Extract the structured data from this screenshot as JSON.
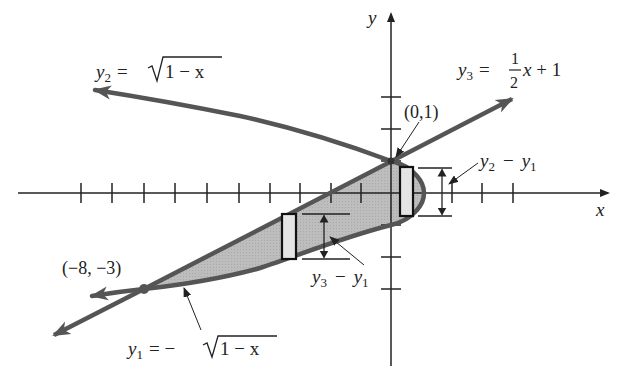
{
  "diagram": {
    "type": "region-between-curves",
    "axes": {
      "x_label": "x",
      "y_label": "y",
      "x_ticks": [
        -10,
        -9,
        -8,
        -7,
        -6,
        -5,
        -4,
        -3,
        -2,
        -1,
        1,
        2,
        3,
        4
      ],
      "y_ticks": [
        -3,
        -2,
        -1,
        1,
        2,
        3
      ]
    },
    "curves": [
      {
        "id": "y2",
        "name": "y",
        "sub": "2",
        "eq": "= ",
        "rad": "1 − x",
        "formula": "y2 = sqrt(1 - x)"
      },
      {
        "id": "y3",
        "name": "y",
        "sub": "3",
        "eq": "= ",
        "frac_num": "1",
        "frac_den": "2",
        "rest": "x + 1",
        "formula": "y3 = (1/2)x + 1"
      },
      {
        "id": "y1",
        "name": "y",
        "sub": "1",
        "eq": "= −",
        "rad": "1 − x",
        "formula": "y1 = -sqrt(1 - x)"
      }
    ],
    "points": [
      {
        "label": "(0,1)",
        "x": 0,
        "y": 1
      },
      {
        "label": "(−8, −3)",
        "x": -8,
        "y": -3
      }
    ],
    "annotations": [
      {
        "label_a": "y",
        "sub_a": "2",
        "op": "−",
        "label_b": "y",
        "sub_b": "1",
        "meaning": "y2 - y1"
      },
      {
        "label_a": "y",
        "sub_a": "3",
        "op": "−",
        "label_b": "y",
        "sub_b": "1",
        "meaning": "y3 - y1"
      }
    ],
    "colors": {
      "curve": "#555555",
      "axis": "#222222",
      "region": "#bdbdbd",
      "strip": "#e2e2e2"
    }
  }
}
